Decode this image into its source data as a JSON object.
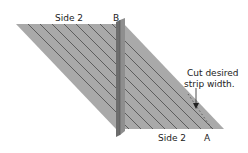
{
  "labels": {
    "top_side": "Side 2",
    "corner_b": "B",
    "bottom_side": "Side 2",
    "corner_a": "A",
    "annotation_line1": "Cut desired",
    "annotation_line2": "strip width."
  },
  "colors": {
    "fabric": "#a9a9a9",
    "stripe": "#4a4a4a",
    "fold_dark": "#6d6d6d",
    "fold_light": "#8e8e8e",
    "text": "#222222",
    "edge": "#cfcfcf"
  }
}
